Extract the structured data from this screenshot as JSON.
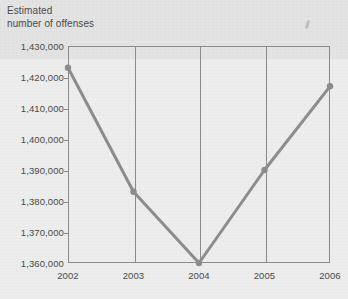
{
  "chart_data": {
    "type": "line",
    "title": "Estimated\nnumber of offenses",
    "xlabel": "",
    "ylabel": "Estimated number of offenses",
    "categories": [
      "2002",
      "2003",
      "2004",
      "2005",
      "2006"
    ],
    "x": [
      2002,
      2003,
      2004,
      2005,
      2006
    ],
    "values": [
      1423000,
      1383000,
      1360000,
      1390000,
      1417000
    ],
    "series": [
      {
        "name": "Estimated number of offenses",
        "values": [
          1423000,
          1383000,
          1360000,
          1390000,
          1417000
        ]
      }
    ],
    "ylim": [
      1360000,
      1430000
    ],
    "ytick_values": [
      1360000,
      1370000,
      1380000,
      1390000,
      1400000,
      1410000,
      1420000,
      1430000
    ],
    "ytick_labels": [
      "1,360,000",
      "1,370,000",
      "1,380,000",
      "1,390,000",
      "1,400,000",
      "1,410,000",
      "1,420,000",
      "1,430,000"
    ],
    "xtick_labels": [
      "2002",
      "2003",
      "2004",
      "2005",
      "2006"
    ],
    "grid": "vertical-only",
    "legend": "none",
    "line_color": "#8c8c8c",
    "marker": "circle",
    "background_color": "#ededed",
    "axis_color": "#8a8a8a",
    "text_color": "#4a4a4a"
  }
}
